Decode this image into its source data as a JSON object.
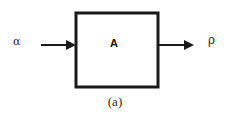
{
  "figure": {
    "caption": "(a)",
    "block": {
      "label": "A",
      "name": "system-block-a"
    },
    "input": {
      "label": "α",
      "direction": "right",
      "name": "input-signal-alpha"
    },
    "output": {
      "label": "ρ",
      "direction": "right",
      "name": "output-signal-rho"
    },
    "colors": {
      "stroke": "#1a1a1a",
      "background": "#ffffff",
      "text": "#2b2b2b"
    }
  }
}
